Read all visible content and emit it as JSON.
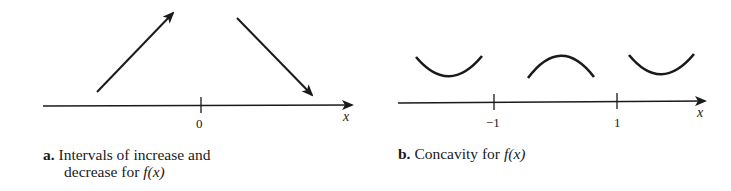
{
  "panel_a": {
    "axis_label": "x",
    "tick_labels": [
      "0"
    ],
    "caption": {
      "letter": "a.",
      "line1": "Intervals of increase and",
      "line2_prefix": "decrease for ",
      "func": "f(x)"
    },
    "arrows": [
      {
        "direction": "increasing",
        "region": "x < 0"
      },
      {
        "direction": "decreasing",
        "region": "x > 0"
      }
    ]
  },
  "panel_b": {
    "axis_label": "x",
    "tick_labels": [
      "−1",
      "1"
    ],
    "caption": {
      "letter": "b.",
      "text_prefix": "Concavity for ",
      "func": "f(x)"
    },
    "concavity": [
      {
        "shape": "concave up",
        "region": "x < -1"
      },
      {
        "shape": "concave down",
        "region": "-1 < x < 1"
      },
      {
        "shape": "concave up",
        "region": "x > 1"
      }
    ]
  },
  "colors": {
    "stroke": "#1a1a1a",
    "background": "#ffffff"
  }
}
